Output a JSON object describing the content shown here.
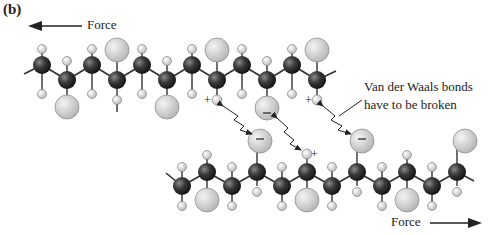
{
  "panel_label": "(b)",
  "labels": {
    "force_top": "Force",
    "force_bottom": "Force",
    "note_line1": "Van der Waals bonds",
    "note_line2": "have to be broken"
  },
  "colors": {
    "carbon": "#2a2a2a",
    "hydrogen": "#d8d8d8",
    "side_group": "#cfcfcf",
    "bond": "#333333",
    "text": "#222222"
  },
  "chains": [
    {
      "name": "top-chain",
      "start_x": 42,
      "step": 25,
      "y_high": 65,
      "y_low": 80,
      "first_high": true,
      "count": 13,
      "big_up": [
        7,
        11
      ],
      "big_up_positions": [
        217,
        317
      ],
      "big_down": [
        1,
        7,
        10
      ],
      "notes": "large side groups alternate"
    },
    {
      "name": "bottom-chain",
      "start_x": 182,
      "step": 25,
      "y_high": 172,
      "y_low": 186,
      "first_high": false,
      "count": 12
    }
  ],
  "charges": [
    "+",
    "+",
    "−",
    "−",
    "−",
    "+"
  ]
}
